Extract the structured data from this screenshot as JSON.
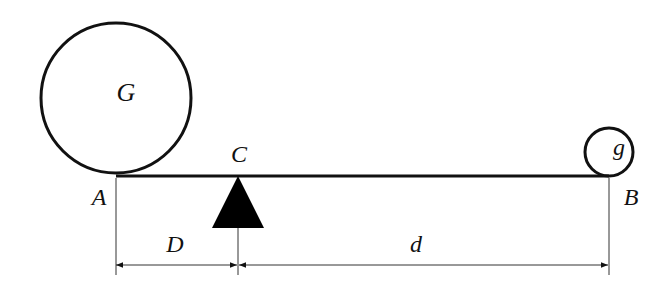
{
  "diagram": {
    "labels": {
      "big_mass": "G",
      "small_mass": "g",
      "fulcrum": "C",
      "left_end": "A",
      "right_end": "B",
      "left_distance": "D",
      "right_distance": "d"
    },
    "colors": {
      "stroke": "#111111",
      "fill_fulcrum": "#000000",
      "background": "#ffffff"
    }
  }
}
